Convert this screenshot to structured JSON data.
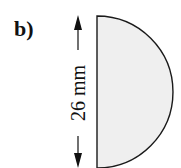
{
  "panel_label": "b)",
  "dimension": {
    "value": "26 mm"
  },
  "shape": {
    "type": "semicircle",
    "fill": "#efefef",
    "stroke": "#1a1a1a"
  }
}
